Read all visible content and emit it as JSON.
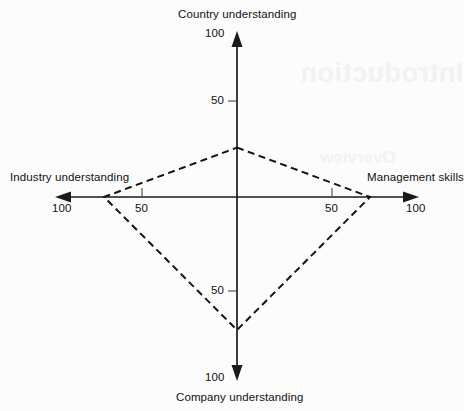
{
  "chart_data": {
    "type": "radar",
    "title": "",
    "subtitle": "",
    "grid": false,
    "legend_position": "none",
    "axes": [
      {
        "id": "top",
        "label": "Country understanding",
        "direction": "up",
        "max": 100,
        "ticks": [
          50,
          100
        ],
        "value": 26
      },
      {
        "id": "right",
        "label": "Management skills",
        "direction": "right",
        "max": 100,
        "ticks": [
          50,
          100
        ],
        "value": 70
      },
      {
        "id": "bottom",
        "label": "Company understanding",
        "direction": "down",
        "max": 100,
        "ticks": [
          50,
          100
        ],
        "value": 70
      },
      {
        "id": "left",
        "label": "Industry understanding",
        "direction": "left",
        "max": 100,
        "ticks": [
          50,
          100
        ],
        "value": 70
      }
    ],
    "categories": [
      "Country understanding",
      "Management skills",
      "Company understanding",
      "Industry understanding"
    ],
    "values": [
      26,
      70,
      70,
      70
    ],
    "series": [
      {
        "name": "Profile",
        "values": [
          26,
          70,
          70,
          70
        ],
        "line_style": "dashed"
      }
    ],
    "xlabel": "",
    "ylabel": "",
    "ylim": [
      0,
      100
    ],
    "xlim": [
      0,
      100
    ]
  },
  "labels": {
    "top_axis": "Country understanding",
    "right_axis": "Management skills",
    "bottom_axis": "Company understanding",
    "left_axis": "Industry understanding"
  },
  "ticks": {
    "top_100": "100",
    "top_50": "50",
    "bottom_50": "50",
    "bottom_100": "100",
    "left_100": "100",
    "left_50": "50",
    "right_50": "50",
    "right_100": "100"
  },
  "ghost": {
    "title": "Introduction",
    "subtitle": "Overview"
  },
  "colors": {
    "background": "#fcfcfc",
    "axis": "#1a1a1a",
    "profile": "#141414",
    "text": "#111111"
  }
}
